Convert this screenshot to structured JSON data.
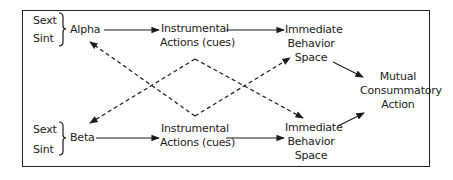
{
  "diagram": {
    "top_row": {
      "states": [
        "Sext",
        "Sint"
      ],
      "agent": "Alpha",
      "instrumental": [
        "Instrumental",
        "Actions (cues)"
      ],
      "immediate": [
        "Immediate",
        "Behavior",
        "Space"
      ]
    },
    "bottom_row": {
      "states": [
        "Sext",
        "Sint"
      ],
      "agent": "Beta",
      "instrumental": [
        "Instrumental",
        "Actions (cues)"
      ],
      "immediate": [
        "Immediate",
        "Behavior",
        "Space"
      ]
    },
    "outcome": [
      "Mutual",
      "Consummatory",
      "Action"
    ],
    "edges": [
      {
        "from": "Alpha",
        "to": "Instrumental Actions (cues) [top]",
        "style": "solid"
      },
      {
        "from": "Instrumental Actions (cues) [top]",
        "to": "Immediate Behavior Space [top]",
        "style": "solid"
      },
      {
        "from": "Beta",
        "to": "Instrumental Actions (cues) [bottom]",
        "style": "solid"
      },
      {
        "from": "Instrumental Actions (cues) [bottom]",
        "to": "Immediate Behavior Space [bottom]",
        "style": "solid"
      },
      {
        "from": "Immediate Behavior Space [top]",
        "to": "Mutual Consummatory Action",
        "style": "solid"
      },
      {
        "from": "Immediate Behavior Space [bottom]",
        "to": "Mutual Consummatory Action",
        "style": "solid"
      },
      {
        "from": "Instrumental Actions (cues) [top]",
        "to": "Beta",
        "style": "dashed"
      },
      {
        "from": "Instrumental Actions (cues) [top]",
        "to": "Immediate Behavior Space [bottom]",
        "style": "dashed"
      },
      {
        "from": "Instrumental Actions (cues) [bottom]",
        "to": "Alpha",
        "style": "dashed"
      },
      {
        "from": "Instrumental Actions (cues) [bottom]",
        "to": "Immediate Behavior Space [top]",
        "style": "dashed"
      }
    ]
  }
}
